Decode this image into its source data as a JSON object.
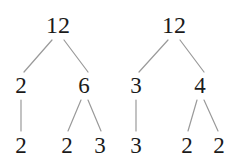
{
  "figure": {
    "title": "",
    "background_color": "#ffffff",
    "text_color": "#1a1a1a",
    "edge_color": "#9a9a9a",
    "edge_width": 1.2
  },
  "chart_data": {
    "type": "diagram",
    "diagram_kind": "factor-tree",
    "title": "",
    "xlabel": "",
    "ylabel": "",
    "trees": [
      {
        "name": "left-tree",
        "root": "12",
        "levels": [
          [
            "12"
          ],
          [
            "2",
            "6"
          ],
          [
            "2",
            "2",
            "3"
          ]
        ],
        "nodes": [
          {
            "id": "L-root",
            "label": "12",
            "x": 58,
            "y": 25,
            "level": 0
          },
          {
            "id": "L-a",
            "label": "2",
            "x": 21,
            "y": 85,
            "level": 1
          },
          {
            "id": "L-b",
            "label": "6",
            "x": 84,
            "y": 85,
            "level": 1
          },
          {
            "id": "L-a1",
            "label": "2",
            "x": 21,
            "y": 145,
            "level": 2
          },
          {
            "id": "L-b1",
            "label": "2",
            "x": 67,
            "y": 145,
            "level": 2
          },
          {
            "id": "L-b2",
            "label": "3",
            "x": 100,
            "y": 145,
            "level": 2
          }
        ],
        "edges": [
          {
            "from": "L-root",
            "to": "L-a",
            "x1": 52,
            "y1": 40,
            "x2": 24,
            "y2": 72
          },
          {
            "from": "L-root",
            "to": "L-b",
            "x1": 64,
            "y1": 40,
            "x2": 88,
            "y2": 72
          },
          {
            "from": "L-a",
            "to": "L-a1",
            "x1": 21,
            "y1": 100,
            "x2": 21,
            "y2": 131
          },
          {
            "from": "L-b",
            "to": "L-b1",
            "x1": 81,
            "y1": 100,
            "x2": 68,
            "y2": 131
          },
          {
            "from": "L-b",
            "to": "L-b2",
            "x1": 88,
            "y1": 100,
            "x2": 101,
            "y2": 131
          }
        ]
      },
      {
        "name": "right-tree",
        "root": "12",
        "levels": [
          [
            "12"
          ],
          [
            "3",
            "4"
          ],
          [
            "3",
            "2",
            "2"
          ]
        ],
        "nodes": [
          {
            "id": "R-root",
            "label": "12",
            "x": 174,
            "y": 25,
            "level": 0
          },
          {
            "id": "R-a",
            "label": "3",
            "x": 136,
            "y": 85,
            "level": 1
          },
          {
            "id": "R-b",
            "label": "4",
            "x": 200,
            "y": 85,
            "level": 1
          },
          {
            "id": "R-a1",
            "label": "3",
            "x": 136,
            "y": 145,
            "level": 2
          },
          {
            "id": "R-b1",
            "label": "2",
            "x": 187,
            "y": 145,
            "level": 2
          },
          {
            "id": "R-b2",
            "label": "2",
            "x": 219,
            "y": 145,
            "level": 2
          }
        ],
        "edges": [
          {
            "from": "R-root",
            "to": "R-a",
            "x1": 168,
            "y1": 40,
            "x2": 139,
            "y2": 72
          },
          {
            "from": "R-root",
            "to": "R-b",
            "x1": 180,
            "y1": 40,
            "x2": 204,
            "y2": 72
          },
          {
            "from": "R-a",
            "to": "R-a1",
            "x1": 136,
            "y1": 100,
            "x2": 136,
            "y2": 131
          },
          {
            "from": "R-b",
            "to": "R-b1",
            "x1": 197,
            "y1": 100,
            "x2": 188,
            "y2": 131
          },
          {
            "from": "R-b",
            "to": "R-b2",
            "x1": 204,
            "y1": 100,
            "x2": 218,
            "y2": 131
          }
        ]
      }
    ]
  }
}
